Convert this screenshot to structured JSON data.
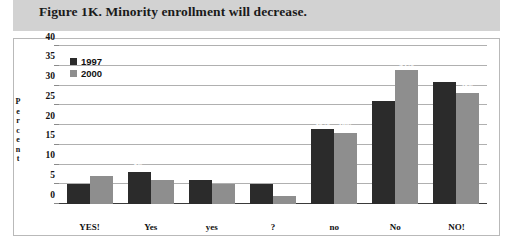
{
  "header": {
    "title": "Figure 1K. Minority enrollment will decrease."
  },
  "chart_data": {
    "type": "bar",
    "title": "Figure 1K. Minority enrollment will decrease.",
    "xlabel": "",
    "ylabel": "Percent",
    "ylim": [
      0,
      40
    ],
    "yticks": [
      0,
      5,
      10,
      15,
      20,
      25,
      30,
      35,
      40
    ],
    "ytick_labels": [
      "0",
      "5",
      "10",
      "15",
      "20",
      "25",
      "30",
      "35",
      "40"
    ],
    "grid": true,
    "legend_position": "top-left",
    "categories": [
      "YES!",
      "Yes",
      "yes",
      "?",
      "no",
      "No",
      "NO!"
    ],
    "series": [
      {
        "name": "1997",
        "color": "#2b2b2b",
        "values": [
          5,
          8,
          6,
          5,
          19,
          26,
          31
        ],
        "labels": [
          "5%",
          "8%",
          "6%",
          "5%",
          "19%",
          "26%",
          "31%"
        ]
      },
      {
        "name": "2000",
        "color": "#8e8e8e",
        "values": [
          7,
          6,
          5,
          2,
          18,
          34,
          28
        ],
        "labels": [
          "7%",
          "6%",
          "5%",
          "2%",
          "18%",
          "34%",
          "28%"
        ]
      }
    ]
  },
  "colors": {
    "header_band": "#d2d2d2",
    "series_1997": "#2b2b2b",
    "series_2000": "#8e8e8e",
    "gridline": "#b0b0b0",
    "plot_background": "#ffffff"
  }
}
